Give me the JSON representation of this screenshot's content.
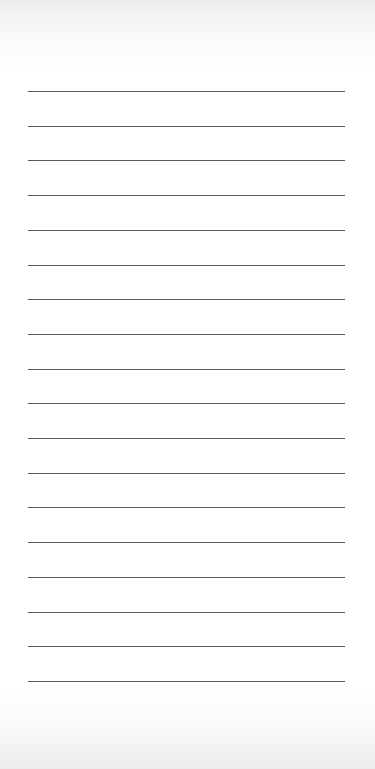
{
  "page": {
    "type": "lined-paper",
    "background_color": "#ffffff",
    "line_color": "#5a5a5a",
    "line_count": 18,
    "line_left": 28,
    "line_width": 317,
    "first_line_y": 91,
    "line_spacing": 34.7
  }
}
